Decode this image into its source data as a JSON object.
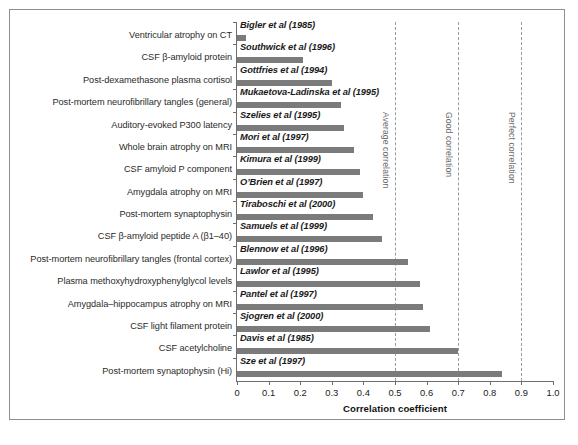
{
  "chart_data": {
    "type": "bar",
    "orientation": "horizontal",
    "title": "",
    "xlabel": "Correlation coefficient",
    "ylabel": "",
    "xlim": [
      0,
      1.0
    ],
    "grid": false,
    "xticks": [
      "0",
      "0.1",
      "0.2",
      "0.3",
      "0.4",
      "0.5",
      "0.6",
      "0.7",
      "0.8",
      "0.9",
      "1.0"
    ],
    "xtick_values": [
      0,
      0.1,
      0.2,
      0.3,
      0.4,
      0.5,
      0.6,
      0.7,
      0.8,
      0.9,
      1.0
    ],
    "bar_color": "#7b7b7b",
    "reference_lines": [
      {
        "value": 0.5,
        "label": "Average correlation"
      },
      {
        "value": 0.7,
        "label": "Good correlation"
      },
      {
        "value": 0.9,
        "label": "Perfect correlation"
      }
    ],
    "categories": [
      "Ventricular atrophy on CT",
      "CSF β-amyloid protein",
      "Post-dexamethasone plasma cortisol",
      "Post-mortem neurofibrillary tangles (general)",
      "Auditory-evoked P300 latency",
      "Whole brain atrophy on MRI",
      "CSF amyloid P component",
      "Amygdala atrophy on MRI",
      "Post-mortem synaptophysin",
      "CSF β-amyloid peptide A (β1–40)",
      "Post-mortem neurofibrillary tangles (frontal cortex)",
      "Plasma methoxyhydroxyphenylglycol levels",
      "Amygdala–hippocampus atrophy on MRI",
      "CSF light filament protein",
      "CSF acetylcholine",
      "Post-mortem synaptophysin (Hi)"
    ],
    "citations": [
      "Bigler et al (1985)",
      "Southwick et al (1996)",
      "Gottfries et al (1994)",
      "Mukaetova-Ladinska et al (1995)",
      "Szelies et al (1995)",
      "Mori et al (1997)",
      "Kimura et al (1999)",
      "O’Brien et al (1997)",
      "Tiraboschi et al (2000)",
      "Samuels et al (1999)",
      "Blennow et al (1996)",
      "Lawlor et al (1995)",
      "Pantel et al (1997)",
      "Sjogren et al (2000)",
      "Davis et al (1985)",
      "Sze et al (1997)"
    ],
    "values": [
      0.03,
      0.21,
      0.3,
      0.33,
      0.34,
      0.37,
      0.39,
      0.4,
      0.43,
      0.46,
      0.54,
      0.58,
      0.59,
      0.61,
      0.7,
      0.84
    ]
  }
}
